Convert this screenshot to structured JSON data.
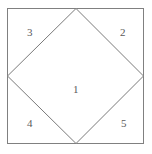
{
  "figure": {
    "canvas": {
      "width": 152,
      "height": 154,
      "background": "#ffffff"
    },
    "colors": {
      "outline": "#808080",
      "diamond": "#7a7a7a",
      "label_text": "#5a5a5a",
      "fill": "#ffffff"
    },
    "outer_square": {
      "name": "outer-square",
      "left": 7,
      "top": 8,
      "right": 144,
      "bottom": 144,
      "stroke_width": 1
    },
    "diamond": {
      "name": "inscribed-diamond",
      "stroke_width": 1,
      "vertices": [
        {
          "name": "top",
          "x": 76,
          "y": 8
        },
        {
          "name": "right",
          "x": 144,
          "y": 76
        },
        {
          "name": "bottom",
          "x": 76,
          "y": 144
        },
        {
          "name": "left",
          "x": 7,
          "y": 76
        }
      ]
    },
    "regions": [
      {
        "id": "center",
        "label": "1",
        "shape": "diamond",
        "position": "center"
      },
      {
        "id": "top-right",
        "label": "2",
        "shape": "triangle",
        "position": "top-right"
      },
      {
        "id": "top-left",
        "label": "3",
        "shape": "triangle",
        "position": "top-left"
      },
      {
        "id": "bottom-left",
        "label": "4",
        "shape": "triangle",
        "position": "bottom-left"
      },
      {
        "id": "bottom-right",
        "label": "5",
        "shape": "triangle",
        "position": "bottom-right"
      }
    ]
  }
}
